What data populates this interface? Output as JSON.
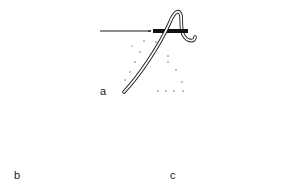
{
  "figure": {
    "panels": [
      {
        "id": "a",
        "label": "a"
      },
      {
        "id": "b",
        "label": "b"
      },
      {
        "id": "c",
        "label": "c"
      }
    ],
    "colors": {
      "line": "#1a1a1a",
      "background": "#ffffff"
    }
  }
}
